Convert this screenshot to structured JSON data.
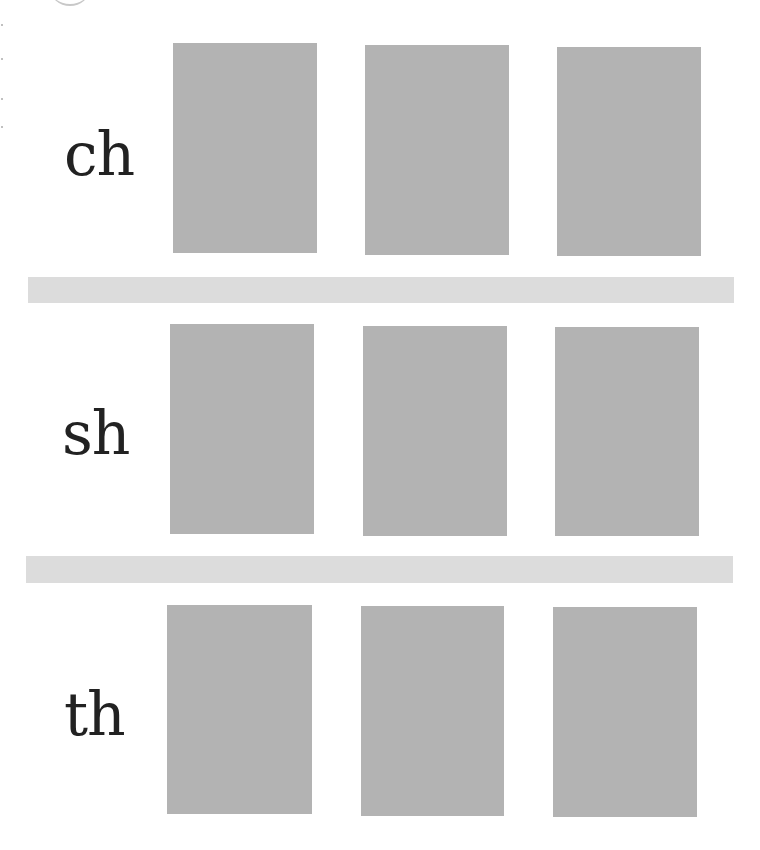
{
  "worksheet": {
    "rows": [
      {
        "label": "ch",
        "boxes": 3
      },
      {
        "label": "sh",
        "boxes": 3
      },
      {
        "label": "th",
        "boxes": 3
      }
    ],
    "colors": {
      "text": "#222222",
      "box": "#b3b3b3",
      "divider": "#dcdcdc",
      "background": "#ffffff"
    }
  }
}
